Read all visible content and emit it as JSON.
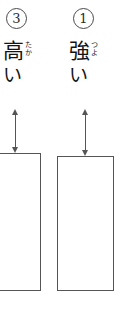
{
  "page": {
    "writing_mode": "vertical",
    "background_color": "#ffffff",
    "line_color": "#555555",
    "text_color": "#141414"
  },
  "items": [
    {
      "index_label": "③",
      "index_number": "3",
      "word": "高い",
      "reading": "たかい",
      "romaji": "takai",
      "base_char": "高",
      "furigana_chars": [
        "た",
        "か"
      ],
      "okurigana": "い",
      "arrow": {
        "type": "double-headed-vertical",
        "label": ""
      },
      "bar": {
        "clipped_left": true,
        "fill": "#ffffff",
        "border": "#555555"
      }
    },
    {
      "index_label": "①",
      "index_number": "1",
      "word": "強い",
      "reading": "つよい",
      "romaji": "tsuyoi",
      "base_char": "強",
      "furigana_chars": [
        "つ",
        "よ"
      ],
      "okurigana": "い",
      "arrow": {
        "type": "double-headed-vertical",
        "label": ""
      },
      "bar": {
        "clipped_left": false,
        "fill": "#ffffff",
        "border": "#555555"
      }
    }
  ]
}
